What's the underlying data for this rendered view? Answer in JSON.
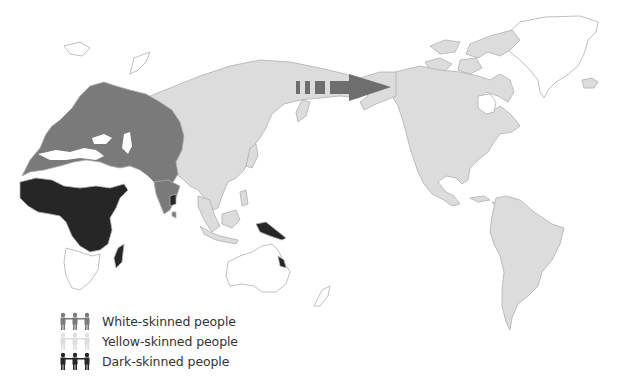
{
  "map": {
    "description": "World map showing distribution of skin-colour groups with a migration arrow across the Bering Strait",
    "colors": {
      "white_skinned": "#7a7a7a",
      "yellow_skinned": "#dcdcdc",
      "dark_skinned": "#262626",
      "ocean": "#ffffff",
      "outline": "#b5b5b5",
      "arrow": "#6e6e6e"
    },
    "arrow": {
      "direction": "east",
      "from": "Siberia",
      "to": "Alaska"
    }
  },
  "legend": {
    "items": [
      {
        "label": "White-skinned people",
        "icon": "people-icon",
        "color": "#7a7a7a"
      },
      {
        "label": "Yellow-skinned people",
        "icon": "people-icon",
        "color": "#dedede"
      },
      {
        "label": "Dark-skinned people",
        "icon": "people-icon",
        "color": "#262626"
      }
    ]
  }
}
